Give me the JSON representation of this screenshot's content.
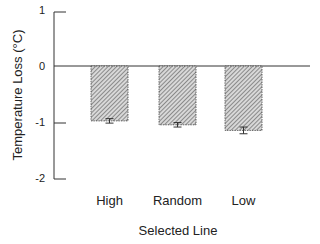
{
  "chart_data": {
    "type": "bar",
    "title": "",
    "xlabel": "Selected Line",
    "ylabel": "Temperature Loss (°C)",
    "categories": [
      "High",
      "Random",
      "Low"
    ],
    "values": [
      -0.98,
      -1.05,
      -1.15
    ],
    "errors": [
      0.04,
      0.04,
      0.06
    ],
    "ylim": [
      -2,
      1
    ],
    "yticks": [
      "1",
      "0",
      "-1",
      "-2"
    ],
    "grid": false,
    "bar_fill": "hatched",
    "bar_color": "#999999"
  }
}
